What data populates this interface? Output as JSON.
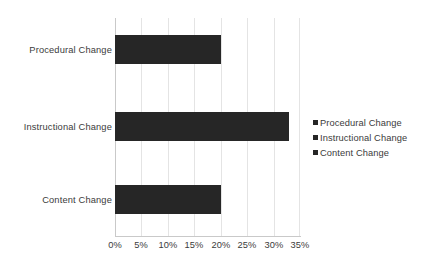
{
  "chart_data": {
    "type": "bar",
    "orientation": "horizontal",
    "title": "",
    "xlabel": "",
    "ylabel": "",
    "categories": [
      "Procedural Change",
      "Instructional Change",
      "Content Change"
    ],
    "values": [
      20,
      33,
      20
    ],
    "value_suffix": "%",
    "xlim": [
      0,
      35
    ],
    "xticks": [
      0,
      5,
      10,
      15,
      20,
      25,
      30,
      35
    ],
    "xtick_labels": [
      "0%",
      "5%",
      "10%",
      "15%",
      "20%",
      "25%",
      "30%",
      "35%"
    ],
    "grid": true,
    "grid_axis": "x",
    "legend": {
      "position": "right",
      "entries": [
        {
          "label": "Procedural Change",
          "color": "#262626"
        },
        {
          "label": "Instructional Change",
          "color": "#262626"
        },
        {
          "label": "Content Change",
          "color": "#262626"
        }
      ]
    },
    "series": [
      {
        "name": "Procedural Change",
        "color": "#262626",
        "points": [
          {
            "category": "Procedural Change",
            "value": 20
          }
        ]
      },
      {
        "name": "Instructional Change",
        "color": "#262626",
        "points": [
          {
            "category": "Instructional Change",
            "value": 33
          }
        ]
      },
      {
        "name": "Content Change",
        "color": "#262626",
        "points": [
          {
            "category": "Content Change",
            "value": 20
          }
        ]
      }
    ],
    "colors": {
      "bar": "#262626",
      "gridline": "#e4e4e4",
      "axis": "#c9c9c9",
      "text": "#3b3b3b",
      "background": "#ffffff"
    }
  }
}
